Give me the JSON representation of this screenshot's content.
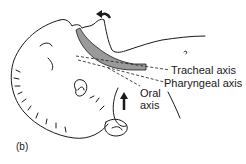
{
  "figure": {
    "panel_label": "(b)",
    "labels": {
      "tracheal": "Tracheal axis",
      "pharyngeal": "Pharyngeal axis",
      "oral_line1": "Oral",
      "oral_line2": "axis"
    },
    "colors": {
      "line": "#1a1a1a",
      "airway_fill": "#9a9a9a"
    }
  }
}
